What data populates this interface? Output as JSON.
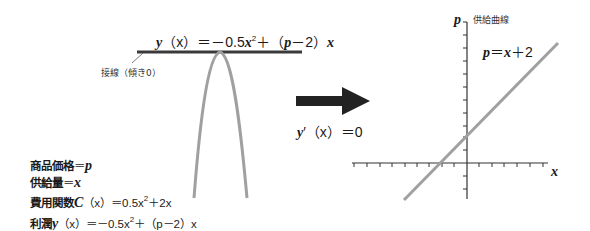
{
  "left_panel": {
    "title_equation": {
      "lhs": "y",
      "arg": "（x）",
      "eq": "＝－0.5",
      "x2": "x",
      "sup": "2",
      "mid": "＋（",
      "p": "p",
      "mid2": "－2）",
      "xend": "x"
    },
    "tangent_label": "接線（傾き0）",
    "given": [
      {
        "label": "商品価格",
        "eq": "＝",
        "var": "p"
      },
      {
        "label": "供給量",
        "eq": "＝",
        "var": "x"
      },
      {
        "label": "費用関数",
        "fn": "C",
        "arg": "（x）",
        "rhs": "＝0.5x",
        "sup": "2",
        "rhs2": "＋2x"
      },
      {
        "label": "利潤",
        "fn": "y",
        "arg": "（x）",
        "rhs": "＝－0.5x",
        "sup": "2",
        "rhs2": "＋（p－2）x"
      }
    ]
  },
  "arrow": {
    "caption_fn": "y",
    "caption_prime": "′",
    "caption_arg": "（x）",
    "caption_rhs": "＝0"
  },
  "right_panel": {
    "y_axis_label": "p",
    "x_axis_label": "x",
    "curve_title": "供給曲線",
    "line_equation": {
      "lhs": "p",
      "eq": "＝",
      "x": "x",
      "rhs": "＋2"
    }
  },
  "colors": {
    "curve": "#a0a0a0",
    "axis": "#333333",
    "arrow": "#222222",
    "tangent": "#3a3a3a"
  }
}
